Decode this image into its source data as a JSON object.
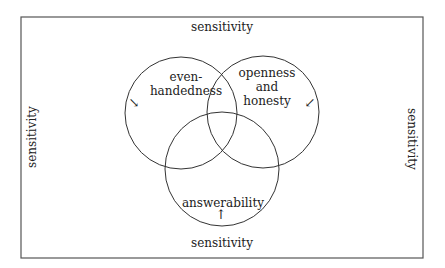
{
  "diagram": {
    "frame_labels": {
      "top": "sensitivity",
      "bottom": "sensitivity",
      "left": "sensitivity",
      "right": "sensitivity"
    },
    "circles": [
      {
        "label_line1": "even-",
        "label_line2": "handedness",
        "arrow": "↘"
      },
      {
        "label_line1": "openness",
        "label_line2": "and",
        "label_line3": "honesty",
        "arrow": "↙"
      },
      {
        "label_line1": "answerability",
        "arrow": "↑"
      }
    ],
    "colors": {
      "stroke": "#333333",
      "text": "#222222",
      "frame": "#555555"
    }
  }
}
